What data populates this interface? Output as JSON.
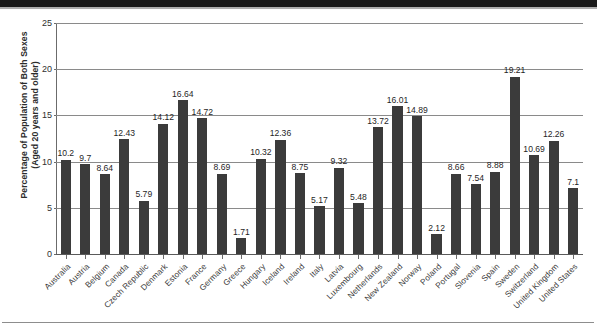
{
  "chart_data": {
    "type": "bar",
    "title": "",
    "xlabel": "",
    "ylabel": "Percentage of Population of Both Sexes\n(Aged 20 years and older)",
    "ylim": [
      0,
      25
    ],
    "yticks": [
      0,
      5,
      10,
      15,
      20,
      25
    ],
    "grid": true,
    "legend": "none",
    "bar_color": "#3b3b3b",
    "gridline_color": "#8a8a8a",
    "categories": [
      "Australia",
      "Austria",
      "Belgium",
      "Canada",
      "Czech Republic",
      "Denmark",
      "Estonia",
      "France",
      "Germany",
      "Greece",
      "Hungary",
      "Iceland",
      "Ireland",
      "Italy",
      "Latvia",
      "Luxembourg",
      "Netherlands",
      "New Zealand",
      "Norway",
      "Poland",
      "Portugal",
      "Slovenia",
      "Spain",
      "Sweden",
      "Switzerland",
      "United Kingdom",
      "United States"
    ],
    "values": [
      10.2,
      9.7,
      8.64,
      12.43,
      5.79,
      14.12,
      16.64,
      14.72,
      8.69,
      1.71,
      10.32,
      12.36,
      8.75,
      5.17,
      9.32,
      5.48,
      13.72,
      16.01,
      14.89,
      2.12,
      8.66,
      7.54,
      8.88,
      19.21,
      10.69,
      12.26,
      7.1
    ],
    "value_labels": [
      "10.2",
      "9.7",
      "8.64",
      "12.43",
      "5.79",
      "14.12",
      "16.64",
      "14.72",
      "8.69",
      "1.71",
      "10.32",
      "12.36",
      "8.75",
      "5.17",
      "9.32",
      "5.48",
      "13.72",
      "16.01",
      "14.89",
      "2.12",
      "8.66",
      "7.54",
      "8.88",
      "19.21",
      "10.69",
      "12.26",
      "7.1"
    ]
  }
}
